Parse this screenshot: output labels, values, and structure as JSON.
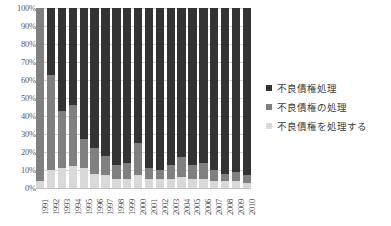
{
  "chart_data": {
    "type": "bar",
    "stacked": true,
    "normalized": true,
    "title": "",
    "xlabel": "",
    "ylabel": "",
    "ylim": [
      0,
      100
    ],
    "grid": true,
    "legend_position": "right",
    "categories": [
      "1991",
      "1992",
      "1993",
      "1994",
      "1995",
      "1996",
      "1997",
      "1998",
      "1999",
      "2000",
      "2001",
      "2002",
      "2003",
      "2004",
      "2005",
      "2006",
      "2007",
      "2008",
      "2009",
      "2010"
    ],
    "ytick_labels": [
      "100%",
      "90%",
      "80%",
      "70%",
      "60%",
      "50%",
      "40%",
      "30%",
      "20%",
      "10%",
      "0%"
    ],
    "ytick_values": [
      100,
      90,
      80,
      70,
      60,
      50,
      40,
      30,
      20,
      10,
      0
    ],
    "series": [
      {
        "name": "不良債権処理",
        "color": "#333333",
        "values": [
          0,
          37,
          57,
          54,
          73,
          78,
          82,
          87,
          86,
          75,
          89,
          90,
          87,
          83,
          87,
          86,
          90,
          92,
          91,
          93
        ]
      },
      {
        "name": "不良債権の処理",
        "color": "#808080",
        "values": [
          96,
          53,
          32,
          34,
          16,
          14,
          11,
          8,
          9,
          18,
          6,
          5,
          8,
          11,
          8,
          9,
          6,
          4,
          5,
          4
        ]
      },
      {
        "name": "不良債権を処理する",
        "color": "#d9d9d9",
        "values": [
          4,
          10,
          11,
          12,
          11,
          8,
          7,
          5,
          5,
          7,
          5,
          5,
          5,
          6,
          5,
          5,
          4,
          4,
          4,
          3
        ]
      }
    ]
  }
}
